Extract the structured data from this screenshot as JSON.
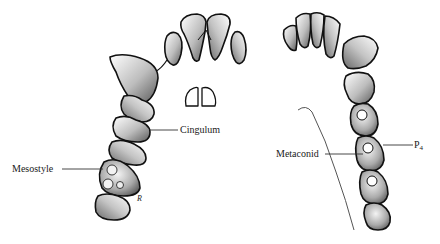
{
  "diagram": {
    "title": "",
    "colors": {
      "outline": "#111111",
      "shade": "#7a7a7a",
      "leader_line": "#333333",
      "background": "#ffffff"
    },
    "left_arch": {
      "name": "upper-jaw",
      "labels": [
        {
          "id": "cingulum",
          "text": "Cingulum"
        },
        {
          "id": "mesostyle",
          "text": "Mesostyle"
        }
      ],
      "signature": "R"
    },
    "right_arch": {
      "name": "lower-jaw",
      "labels": [
        {
          "id": "metaconid",
          "text": "Metaconid"
        },
        {
          "id": "p4",
          "text": "P",
          "subscript": "4"
        }
      ]
    }
  }
}
